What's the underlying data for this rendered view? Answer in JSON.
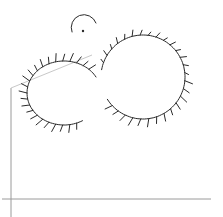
{
  "image": {
    "description": "Hand-drawn line sketch of a fuzzy two-lobed shape with a small head, over thin gray axis lines",
    "colors": {
      "background": "#ffffff",
      "ink": "#2a2a2a",
      "guide": "#9a9a9a"
    },
    "shapes": {
      "left_lobe": {
        "cx": 64,
        "cy": 93,
        "rx": 37,
        "ry": 32
      },
      "right_lobe": {
        "cx": 143,
        "cy": 77,
        "rx": 42,
        "ry": 42
      },
      "head": {
        "cx": 83,
        "cy": 19,
        "r": 11
      },
      "eye": {
        "cx": 83,
        "cy": 31,
        "r": 1.2
      }
    },
    "guides": {
      "horizontal": {
        "x1": 2,
        "y1": 199,
        "x2": 211,
        "y2": 199
      },
      "vertical": {
        "x1": 11,
        "y1": 88,
        "x2": 11,
        "y2": 217
      },
      "diagonal": {
        "x1": 11,
        "y1": 88,
        "x2": 92,
        "y2": 55
      }
    }
  }
}
